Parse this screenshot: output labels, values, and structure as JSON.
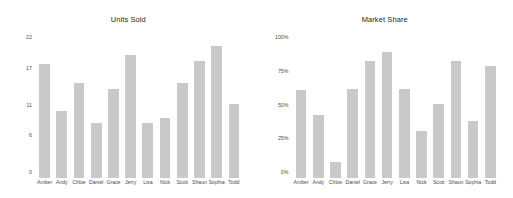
{
  "figure": {
    "background": "#ffffff",
    "bar_color": "#c9c9c9",
    "tick_color": "#4d4d4d",
    "title_color": "#262626"
  },
  "chart_data": [
    {
      "type": "bar",
      "title": "Units Sold",
      "xlabel": "",
      "ylabel": "",
      "grid": false,
      "legend": false,
      "categories": [
        "Amber",
        "Andy",
        "Chloe",
        "Daniel",
        "Grace",
        "Jerry",
        "Lisa",
        "Nick",
        "Scott",
        "Shaun",
        "Sophia",
        "Todd"
      ],
      "values": [
        18.5,
        11,
        15.5,
        9,
        14.5,
        20,
        9,
        9.8,
        15.5,
        19,
        21.5,
        12
      ],
      "ylim": [
        0,
        22
      ],
      "yticks": [
        0,
        6,
        11,
        17,
        22
      ],
      "ytick_labels": [
        "0",
        "6",
        "11",
        "17",
        "22"
      ]
    },
    {
      "type": "bar",
      "title": "Market Share",
      "xlabel": "",
      "ylabel": "",
      "grid": false,
      "legend": false,
      "categories": [
        "Amber",
        "Andy",
        "Chloe",
        "Daniel",
        "Grace",
        "Jerry",
        "Lisa",
        "Nick",
        "Scott",
        "Shaun",
        "Sophia",
        "Todd"
      ],
      "values": [
        65,
        47,
        12,
        66,
        87,
        93,
        66,
        35,
        55,
        87,
        42,
        83
      ],
      "ylim": [
        0,
        100
      ],
      "yticks": [
        0,
        25,
        50,
        75,
        100
      ],
      "ytick_labels": [
        "0%",
        "25%",
        "50%",
        "75%",
        "100%"
      ]
    }
  ]
}
